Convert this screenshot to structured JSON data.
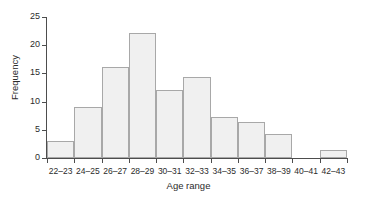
{
  "chart_data": {
    "type": "bar",
    "title": "",
    "subtitle": "",
    "xlabel": "Age range",
    "ylabel": "Frequency",
    "categories": [
      "22–23",
      "24–25",
      "26–27",
      "28–29",
      "30–31",
      "32–33",
      "34–35",
      "36–37",
      "38–39",
      "40–41",
      "42–43"
    ],
    "values": [
      3.0,
      9.0,
      16.2,
      22.2,
      12.1,
      14.3,
      7.2,
      6.3,
      4.3,
      0,
      1.4
    ],
    "ylim": [
      0,
      25
    ],
    "yticks": [
      0,
      5,
      10,
      15,
      20,
      25
    ],
    "ytick_labels": [
      "0",
      "5",
      "10",
      "15",
      "20",
      "25"
    ],
    "grid": false,
    "legend": false,
    "legend_position": "none",
    "bar_fill_color": "#f0f0f0",
    "bar_edge_color": "#a8a8a8",
    "axis_color": "#4d4d4d",
    "background_color": "#ffffff",
    "text_color": "#2b2b2b"
  }
}
